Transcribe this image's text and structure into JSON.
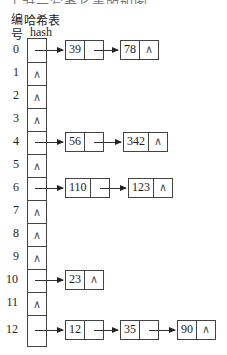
{
  "header": {
    "index_label": "编号",
    "table_label": "哈希表",
    "hash_label": "hash",
    "top_cropped_text": "于对示写希长表的如图……所示"
  },
  "null_symbol": "∧",
  "buckets": [
    {
      "index": "0",
      "chain": [
        "39",
        "78"
      ]
    },
    {
      "index": "1",
      "chain": []
    },
    {
      "index": "2",
      "chain": []
    },
    {
      "index": "3",
      "chain": []
    },
    {
      "index": "4",
      "chain": [
        "56",
        "342"
      ]
    },
    {
      "index": "5",
      "chain": []
    },
    {
      "index": "6",
      "chain": [
        "110",
        "123"
      ]
    },
    {
      "index": "7",
      "chain": []
    },
    {
      "index": "8",
      "chain": []
    },
    {
      "index": "9",
      "chain": []
    },
    {
      "index": "10",
      "chain": [
        "23"
      ]
    },
    {
      "index": "11",
      "chain": []
    },
    {
      "index": "12",
      "chain": [
        "12",
        "35",
        "90"
      ]
    }
  ]
}
